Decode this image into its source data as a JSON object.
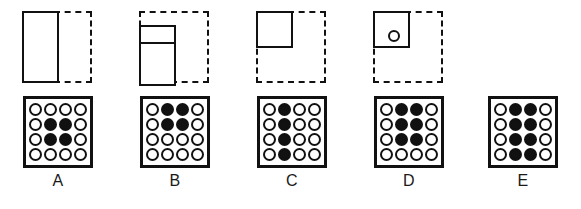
{
  "puzzle": {
    "type": "figure-matrix-multiple-choice",
    "option_count": 5,
    "grid_rows": 4,
    "grid_cols": 4,
    "colors": {
      "ink": "#111111",
      "background": "#ffffff",
      "filled_circle": "#111111",
      "empty_circle": "#ffffff"
    }
  },
  "options": [
    {
      "label": "A",
      "figure": {
        "frame": "dashed-square",
        "shape": "tall-left-rectangle",
        "shape_description": "solid rectangle covering the left half of the dashed square, full height",
        "has_divider": false,
        "has_inner_circle": false,
        "present": true
      },
      "grid": {
        "filled_description": "center 2 by 2 block, rows 2-3 and columns 2-3",
        "filled_count": 4,
        "cells": [
          [
            0,
            0,
            0,
            0
          ],
          [
            0,
            1,
            1,
            0
          ],
          [
            0,
            1,
            1,
            0
          ],
          [
            0,
            0,
            0,
            0
          ]
        ]
      }
    },
    {
      "label": "B",
      "figure": {
        "frame": "dashed-square",
        "shape": "lower-left-rectangle-with-divider",
        "shape_description": "solid rectangle on the left, shifted down, with a horizontal divider near its top",
        "has_divider": true,
        "has_inner_circle": false,
        "present": true
      },
      "grid": {
        "filled_description": "top-center 2 by 2 block, rows 1-2 and columns 2-3",
        "filled_count": 4,
        "cells": [
          [
            0,
            1,
            1,
            0
          ],
          [
            0,
            1,
            1,
            0
          ],
          [
            0,
            0,
            0,
            0
          ],
          [
            0,
            0,
            0,
            0
          ]
        ]
      }
    },
    {
      "label": "C",
      "figure": {
        "frame": "dashed-square",
        "shape": "top-left-square",
        "shape_description": "solid square occupying the top-left quadrant of the dashed square",
        "has_divider": false,
        "has_inner_circle": false,
        "present": true
      },
      "grid": {
        "filled_description": "full second column, all 4 rows of column 2",
        "filled_count": 4,
        "cells": [
          [
            0,
            1,
            0,
            0
          ],
          [
            0,
            1,
            0,
            0
          ],
          [
            0,
            1,
            0,
            0
          ],
          [
            0,
            1,
            0,
            0
          ]
        ]
      }
    },
    {
      "label": "D",
      "figure": {
        "frame": "dashed-square",
        "shape": "top-left-square-with-circle",
        "shape_description": "solid square in the top-left quadrant containing a small hollow circle",
        "has_divider": false,
        "has_inner_circle": true,
        "present": true
      },
      "grid": {
        "filled_description": "3 by 2 block, rows 1-3 and columns 2-3",
        "filled_count": 6,
        "cells": [
          [
            0,
            1,
            1,
            0
          ],
          [
            0,
            1,
            1,
            0
          ],
          [
            0,
            1,
            1,
            0
          ],
          [
            0,
            0,
            0,
            0
          ]
        ]
      }
    },
    {
      "label": "E",
      "figure": {
        "frame": "none",
        "shape": "none",
        "shape_description": "no figure shown above this option",
        "has_divider": false,
        "has_inner_circle": false,
        "present": false
      },
      "grid": {
        "filled_description": "4 by 2 block, all rows of columns 2-3",
        "filled_count": 8,
        "cells": [
          [
            0,
            1,
            1,
            0
          ],
          [
            0,
            1,
            1,
            0
          ],
          [
            0,
            1,
            1,
            0
          ],
          [
            0,
            1,
            1,
            0
          ]
        ]
      }
    }
  ]
}
